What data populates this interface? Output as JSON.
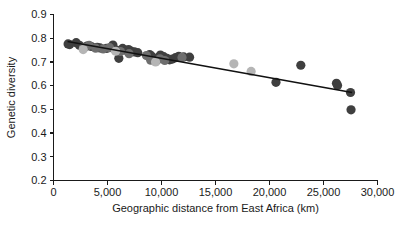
{
  "chart_data": {
    "type": "scatter",
    "title": "",
    "xlabel": "Geographic distance from East Africa (km)",
    "ylabel": "Genetic diversity",
    "xlim": [
      0,
      30000
    ],
    "ylim": [
      0.2,
      0.9
    ],
    "xticks": [
      0,
      5000,
      10000,
      15000,
      20000,
      25000,
      30000
    ],
    "xtick_labels": [
      "0",
      "5,000",
      "10,000",
      "15,000",
      "20,000",
      "25,000",
      "30,000"
    ],
    "yticks": [
      0.2,
      0.3,
      0.4,
      0.5,
      0.6,
      0.7,
      0.8,
      0.9
    ],
    "ytick_labels": [
      "0.2",
      "0.3",
      "0.4",
      "0.5",
      "0.6",
      "0.7",
      "0.8",
      "0.9"
    ],
    "grid": false,
    "legend": "none",
    "marker_size": 4.6,
    "colors": {
      "dark": "#3f3f3f",
      "medium": "#6e6e6e",
      "light": "#b5b5b5",
      "axis": "#1a1a1a",
      "trendline": "#111111"
    },
    "series": [
      {
        "name": "dark",
        "color": "#3f3f3f",
        "points": [
          [
            1350,
            0.776
          ],
          [
            1500,
            0.773
          ],
          [
            2100,
            0.781
          ],
          [
            2400,
            0.77
          ],
          [
            3100,
            0.767
          ],
          [
            3500,
            0.765
          ],
          [
            4050,
            0.762
          ],
          [
            4300,
            0.759
          ],
          [
            4900,
            0.757
          ],
          [
            5500,
            0.771
          ],
          [
            5700,
            0.752
          ],
          [
            5900,
            0.748
          ],
          [
            6050,
            0.715
          ],
          [
            6400,
            0.757
          ],
          [
            6700,
            0.749
          ],
          [
            6950,
            0.752
          ],
          [
            7200,
            0.745
          ],
          [
            7500,
            0.742
          ],
          [
            7800,
            0.739
          ],
          [
            8900,
            0.731
          ],
          [
            9100,
            0.724
          ],
          [
            9300,
            0.711
          ],
          [
            9500,
            0.704
          ],
          [
            9700,
            0.718
          ],
          [
            9900,
            0.729
          ],
          [
            10200,
            0.722
          ],
          [
            10500,
            0.715
          ],
          [
            10750,
            0.709
          ],
          [
            11000,
            0.712
          ],
          [
            11300,
            0.718
          ],
          [
            11600,
            0.724
          ],
          [
            12050,
            0.721
          ],
          [
            12600,
            0.72
          ],
          [
            20600,
            0.614
          ],
          [
            22900,
            0.686
          ],
          [
            26200,
            0.61
          ],
          [
            26300,
            0.601
          ],
          [
            27500,
            0.571
          ],
          [
            27550,
            0.498
          ]
        ]
      },
      {
        "name": "medium",
        "color": "#6e6e6e",
        "points": [
          [
            2800,
            0.762
          ],
          [
            3300,
            0.77
          ],
          [
            3900,
            0.758
          ],
          [
            4600,
            0.755
          ],
          [
            5200,
            0.76
          ],
          [
            6200,
            0.744
          ],
          [
            7000,
            0.735
          ],
          [
            8600,
            0.727
          ],
          [
            9000,
            0.707
          ],
          [
            9850,
            0.713
          ],
          [
            10300,
            0.706
          ],
          [
            11900,
            0.719
          ]
        ]
      },
      {
        "name": "light",
        "color": "#b5b5b5",
        "points": [
          [
            2750,
            0.752
          ],
          [
            5750,
            0.745
          ],
          [
            9450,
            0.7
          ],
          [
            16700,
            0.692
          ],
          [
            18300,
            0.66
          ]
        ]
      }
    ],
    "trendline": {
      "x0": 1300,
      "y0": 0.786,
      "x1": 27650,
      "y1": 0.571
    }
  }
}
